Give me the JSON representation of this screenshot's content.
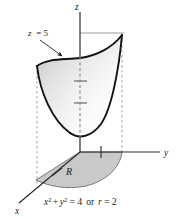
{
  "figure": {
    "axes": {
      "z_label": "z",
      "y_label": "y",
      "x_label": "x"
    },
    "annotations": {
      "plane_label": "z = 5",
      "plane_label_var": "z",
      "plane_label_rest": "= 5",
      "region_label": "R",
      "equation_full": "x² + y² = 4  or  r = 2",
      "equation_parts": {
        "x_var": "x",
        "x_exp": "2",
        "plus": "+",
        "y_var": "y",
        "y_exp": "2",
        "equals_four": "= 4",
        "or_word": "or",
        "r_var": "r",
        "equals_two": "= 2"
      }
    },
    "colors": {
      "outline": "#111111",
      "axis": "#2b2b2b",
      "guide": "#9a9a9a",
      "dashed": "#a8a8a8",
      "region_fill": "#c9c9c9",
      "region_edge": "#6e6e6e",
      "surface_light": "#ffffff",
      "surface_shade": "#d2d2d2",
      "background": "#ffffff"
    },
    "geometry": {
      "origin": [
        80,
        152
      ],
      "z_axis_top": [
        80,
        12
      ],
      "y_axis_end": [
        163,
        152
      ],
      "x_axis_end": [
        17,
        206
      ],
      "cap_height_y": 33,
      "left_dashed_x": 37,
      "right_dashed_x": 122,
      "z_tick_count": 2,
      "radius_label": 2
    }
  }
}
